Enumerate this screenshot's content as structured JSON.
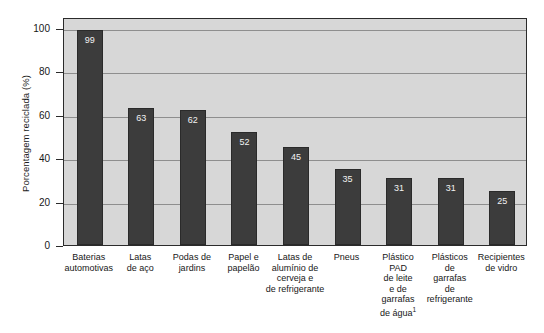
{
  "chart_data": {
    "type": "bar",
    "title": "",
    "xlabel": "",
    "ylabel": "Porcentagem reciclada (%)",
    "ylim": [
      0,
      105
    ],
    "yticks": [
      0,
      20,
      40,
      60,
      80,
      100
    ],
    "ytick_labels": [
      "0",
      "20",
      "40",
      "60",
      "80",
      "100"
    ],
    "grid": true,
    "legend": "none",
    "bar_color": "#3c3c3c",
    "plot_background": "#d7d7d7",
    "categories": [
      "Baterias automotivas",
      "Latas de aço",
      "Podas de jardins",
      "Papel e papelão",
      "Latas de alumínio de cerveja e de refrigerante",
      "Pneus",
      "Plástico PAD de leite e de garrafas de água¹",
      "Plásticos de garrafas de refrigerante",
      "Recipientes de vidro"
    ],
    "category_lines": [
      [
        "Baterias",
        "automotivas"
      ],
      [
        "Latas",
        "de aço"
      ],
      [
        "Podas de",
        "jardins"
      ],
      [
        "Papel e",
        "papelão"
      ],
      [
        "Latas de",
        "alumínio de",
        "cerveja e",
        "de refrigerante"
      ],
      [
        "Pneus"
      ],
      [
        "Plástico",
        "PAD",
        "de leite",
        "e de",
        "garrafas",
        "de água¹"
      ],
      [
        "Plásticos",
        "de",
        "garrafas",
        "de",
        "refrigerante"
      ],
      [
        "Recipientes",
        "de vidro"
      ]
    ],
    "values": [
      99,
      63,
      62,
      52,
      45,
      35,
      31,
      31,
      25
    ],
    "value_labels": [
      "99",
      "63",
      "62",
      "52",
      "45",
      "35",
      "31",
      "31",
      "25"
    ]
  }
}
